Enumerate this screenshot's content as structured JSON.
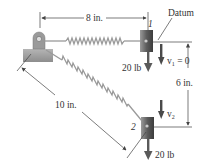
{
  "diagram": {
    "labels": {
      "top_dimension": "8 in.",
      "diagonal_dimension": "10 in.",
      "vertical_dimension": "6 in.",
      "datum": "Datum",
      "position_1": "1",
      "position_2": "2",
      "weight_1": "20 lb",
      "weight_2": "20 lb",
      "velocity_1": "v",
      "velocity_1_sub": "1",
      "velocity_1_value": " = 0",
      "velocity_2": "v",
      "velocity_2_sub": "2"
    },
    "colors": {
      "block": "#6a6a6a",
      "spring": "#9a9a9a",
      "support": "#a8a8a8",
      "arrow": "#5a5a5a",
      "line": "#444444",
      "text": "#333333"
    }
  }
}
